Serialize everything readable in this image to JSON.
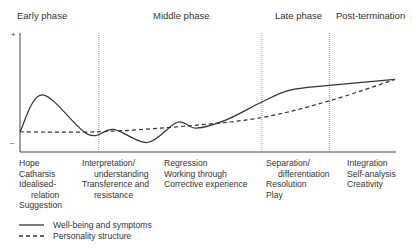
{
  "phases": [
    "Early phase",
    "Middle phase",
    "Late phase",
    "Post-termination"
  ],
  "axis": {
    "plus_label": "+",
    "minus_label": "–"
  },
  "columns": [
    {
      "items": [
        {
          "text": "Hope",
          "indent": false
        },
        {
          "text": "Catharsis",
          "indent": false
        },
        {
          "text": "Idealised-",
          "indent": false
        },
        {
          "text": "relation",
          "indent": true
        },
        {
          "text": "Suggestion",
          "indent": false
        }
      ]
    },
    {
      "items": [
        {
          "text": "Interpretation/",
          "indent": false
        },
        {
          "text": "understanding",
          "indent": true
        },
        {
          "text": "Transference and",
          "indent": false
        },
        {
          "text": "resistance",
          "indent": true
        }
      ]
    },
    {
      "items": [
        {
          "text": "Regression",
          "indent": false
        },
        {
          "text": "Working through",
          "indent": false
        },
        {
          "text": "Corrective experience",
          "indent": false
        }
      ]
    },
    {
      "items": [
        {
          "text": "Separation/",
          "indent": false
        },
        {
          "text": "differentiation",
          "indent": true
        },
        {
          "text": "Resolution",
          "indent": false
        },
        {
          "text": "Play",
          "indent": false
        }
      ]
    },
    {
      "items": [
        {
          "text": "Integration",
          "indent": false
        },
        {
          "text": "Self-analysis",
          "indent": false
        },
        {
          "text": "Creativity",
          "indent": false
        }
      ]
    }
  ],
  "legend": [
    {
      "label": "Well-being and symptoms",
      "style": "solid"
    },
    {
      "label": "Personality structure",
      "style": "dashed"
    }
  ],
  "chart_data": {
    "type": "line",
    "title": "",
    "xlabel": "Therapy phase (time)",
    "ylabel": "– to +",
    "x_phase_boundaries": [
      0.21,
      0.645,
      0.825
    ],
    "ylim": [
      0,
      1
    ],
    "xlim": [
      0,
      1
    ],
    "series": [
      {
        "name": "Well-being and symptoms",
        "style": "solid",
        "x": [
          0.0,
          0.06,
          0.18,
          0.25,
          0.34,
          0.42,
          0.47,
          0.55,
          0.645,
          0.72,
          0.825,
          1.0
        ],
        "y": [
          0.17,
          0.48,
          0.15,
          0.19,
          0.08,
          0.25,
          0.2,
          0.27,
          0.42,
          0.52,
          0.56,
          0.61
        ]
      },
      {
        "name": "Personality structure",
        "style": "dashed",
        "x": [
          0.0,
          0.21,
          0.45,
          0.645,
          0.825,
          1.0
        ],
        "y": [
          0.17,
          0.17,
          0.22,
          0.29,
          0.43,
          0.61
        ]
      }
    ]
  }
}
